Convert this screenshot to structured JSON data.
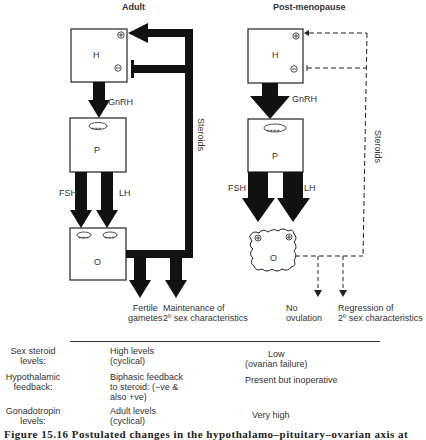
{
  "panels": {
    "adult": {
      "title": "Adult",
      "hypothalamus": "H",
      "pituitary": "P",
      "ovary": "O",
      "pituitary_mark": "+++",
      "ovary_marks": [
        "+++",
        "+++"
      ],
      "h_marks": [
        "⊕",
        "⊖"
      ],
      "gnrh_label": "GnRH",
      "fsh_label": "FSH",
      "lh_label": "LH",
      "feedback_label": "Steroids",
      "outputs": [
        "Fertile\ngametes",
        "Maintenance of\n2º sex characteristics"
      ]
    },
    "post_menopause": {
      "title": "Post-menopause",
      "hypothalamus": "H",
      "pituitary": "P",
      "ovary": "O",
      "pituitary_mark": "++++",
      "ovary_marks": [
        "⊕",
        "⊕"
      ],
      "h_marks": [
        "⊕",
        "⊖"
      ],
      "gnrh_label": "GnRH",
      "fsh_label": "FSH",
      "lh_label": "LH",
      "feedback_label": "Steroids",
      "outputs": [
        "No\novulation",
        "Regression of\n2º sex characteristics"
      ]
    }
  },
  "table": {
    "rows": [
      {
        "label": "Sex steroid\nlevels:",
        "adult": "High levels\n(cyclical)",
        "post": "Low\n(ovarian failure)"
      },
      {
        "label": "Hypothalamic\nfeedback:",
        "adult": "Biphasic feedback\nto steroid: (−ve &\nalso +ve)",
        "post": "Present but inoperative"
      },
      {
        "label": "Gonadotropin\nlevels:",
        "adult": "Adult levels\n(cyclical)",
        "post": "Very high"
      }
    ]
  },
  "caption": "Figure 15.16   Postulated changes in the hypothalamo–pituitary–ovarian axis at"
}
